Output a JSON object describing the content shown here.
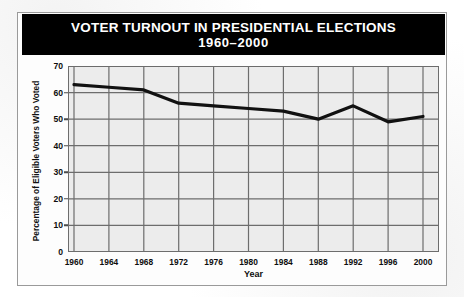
{
  "figure": {
    "title_line1": "VOTER TURNOUT IN PRESIDENTIAL ELECTIONS",
    "title_line2": "1960–2000"
  },
  "chart_data": {
    "type": "line",
    "title": "VOTER TURNOUT IN PRESIDENTIAL ELECTIONS 1960–2000",
    "xlabel": "Year",
    "ylabel": "Percentage of Eligible Voters Who Voted",
    "categories": [
      1960,
      1964,
      1968,
      1972,
      1976,
      1980,
      1984,
      1988,
      1992,
      1996,
      2000
    ],
    "values": [
      63,
      62,
      61,
      56,
      55,
      54,
      53,
      50,
      55,
      49,
      51
    ],
    "xlim": [
      1960,
      2000
    ],
    "ylim": [
      0,
      70
    ],
    "yticks": [
      0,
      10,
      20,
      30,
      40,
      50,
      60,
      70
    ],
    "xticks": [
      1960,
      1964,
      1968,
      1972,
      1976,
      1980,
      1984,
      1988,
      1992,
      1996,
      2000
    ],
    "grid": true,
    "legend": "none",
    "line_color": "#111111",
    "plot_background": "#ececec",
    "grid_color": "#6d6d6d"
  }
}
